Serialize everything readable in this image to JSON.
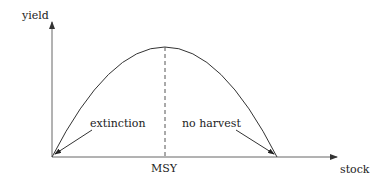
{
  "diagram": {
    "title": "",
    "axes": {
      "x_label": "stock",
      "y_label": "yield"
    },
    "curve": {
      "type": "parabola",
      "description": "yield as a function of stock, zero at both ends, maximum in the middle"
    },
    "annotations": {
      "peak_marker_label": "MSY",
      "left_point_label": "extinction",
      "right_point_label": "no harvest"
    },
    "colors": {
      "line": "#333333",
      "axis": "#555555",
      "background": "#ffffff"
    }
  }
}
